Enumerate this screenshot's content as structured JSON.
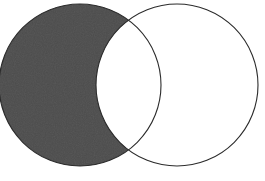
{
  "figure": {
    "type": "venn-two-set",
    "shaded_region_name": "A minus B",
    "shaded_region_description": "Left circle shaded, excluding the lens-shaped overlap with the right circle",
    "canvas": {
      "width": 265,
      "height": 181
    },
    "background_color": "#ffffff"
  },
  "style": {
    "fill_color": "#4c4c4c",
    "fill_texture": "fine noise / mezzotint stipple",
    "outline_color": "#2b2b2b",
    "outline_width": 1.1,
    "unfilled_color": "#ffffff"
  },
  "sets": [
    {
      "id": "A",
      "name": "left-circle",
      "cx": 80,
      "cy": 85,
      "r": 81,
      "filled": true,
      "fill": "#4c4c4c",
      "clipped_at_left_edge": true
    },
    {
      "id": "B",
      "name": "right-circle",
      "cx": 177,
      "cy": 85,
      "r": 81,
      "filled": false,
      "fill": "#ffffff",
      "clipped_at_left_edge": false
    }
  ],
  "intersection": {
    "name": "lens-overlap",
    "filled": false,
    "fill": "#ffffff",
    "upper_point": {
      "x": 128,
      "y": 18
    },
    "lower_point": {
      "x": 128,
      "y": 150
    }
  }
}
